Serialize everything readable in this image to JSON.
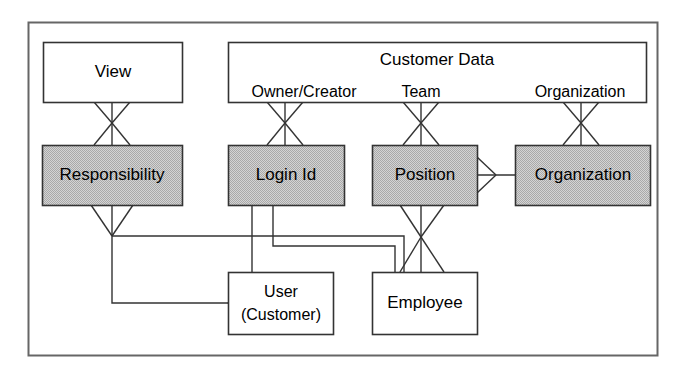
{
  "diagram": {
    "type": "entity-relationship-diagram",
    "frame": {
      "stroke": "#555555"
    },
    "colors": {
      "shaded_fill": "#c6c6c6",
      "plain_fill": "#ffffff",
      "stroke": "#333333",
      "text": "#000000"
    },
    "entities": [
      {
        "id": "view",
        "label": "View",
        "shaded": false
      },
      {
        "id": "responsibility",
        "label": "Responsibility",
        "shaded": true
      },
      {
        "id": "login_id",
        "label": "Login Id",
        "shaded": true
      },
      {
        "id": "position",
        "label": "Position",
        "shaded": true
      },
      {
        "id": "organization",
        "label": "Organization",
        "shaded": true
      },
      {
        "id": "user",
        "label_line1": "User",
        "label_line2": "(Customer)",
        "shaded": false
      },
      {
        "id": "employee",
        "label": "Employee",
        "shaded": false
      }
    ],
    "group": {
      "id": "customer_data",
      "title": "Customer Data",
      "ports": [
        {
          "id": "owner_creator",
          "label": "Owner/Creator"
        },
        {
          "id": "team",
          "label": "Team"
        },
        {
          "id": "organization",
          "label": "Organization"
        }
      ]
    },
    "relationships": [
      {
        "from": "view",
        "to": "responsibility",
        "style": "many-to-many"
      },
      {
        "from": "owner_creator",
        "to": "login_id",
        "style": "many-to-many"
      },
      {
        "from": "team",
        "to": "position",
        "style": "many-to-many"
      },
      {
        "from": "organization",
        "to": "organization",
        "style": "many-to-many"
      },
      {
        "from": "position",
        "to": "organization",
        "style": "many-horizontal"
      },
      {
        "from": "position",
        "to": "employee",
        "style": "many-to-many"
      },
      {
        "from": "responsibility",
        "to": "user",
        "style": "many"
      },
      {
        "from": "login_id",
        "to": "user",
        "style": "plain"
      },
      {
        "from": "login_id",
        "to": "employee",
        "style": "plain"
      },
      {
        "from": "responsibility",
        "to": "employee",
        "style": "plain"
      }
    ]
  }
}
